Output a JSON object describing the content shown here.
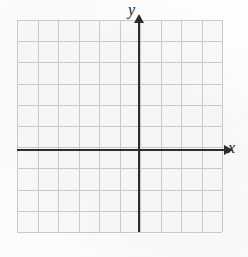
{
  "figure": {
    "kind": "blank-cartesian-coordinate-grid",
    "background_color": "#fdfdfc",
    "grid_line_color": "#c9c9ca",
    "axis_color": "#2e2e2e"
  },
  "axes": {
    "x": {
      "label": "x",
      "label_style": "italic-serif",
      "arrow_direction": "right",
      "origin_pixel_y": 149,
      "start_pixel_x": 17,
      "end_pixel_x": 224
    },
    "y": {
      "label": "y",
      "label_style": "italic-serif",
      "arrow_direction": "up",
      "origin_pixel_x": 138,
      "start_pixel_y": 232,
      "end_pixel_y": 22
    }
  },
  "chart_data": {
    "type": "scatter",
    "title": "",
    "subtitle": "",
    "xlabel": "x",
    "ylabel": "y",
    "series": [
      {
        "name": "",
        "x": [],
        "y": []
      }
    ],
    "annotations": [],
    "legend": {
      "entries": [],
      "position": "none",
      "visible": false
    },
    "grid": {
      "visible": true,
      "columns": 10,
      "rows": 10,
      "cell_width_px": 20.5,
      "cell_height_px": 21.2,
      "left_px": 17,
      "top_px": 20,
      "width_px": 205,
      "height_px": 212
    },
    "xlim": [
      -6,
      4
    ],
    "ylim": [
      -4,
      6
    ],
    "xticks": [],
    "yticks": [],
    "xticklabels": [],
    "yticklabels": [],
    "note": "Empty graph paper grid with labeled x and y axes; no plotted data points or curves."
  }
}
